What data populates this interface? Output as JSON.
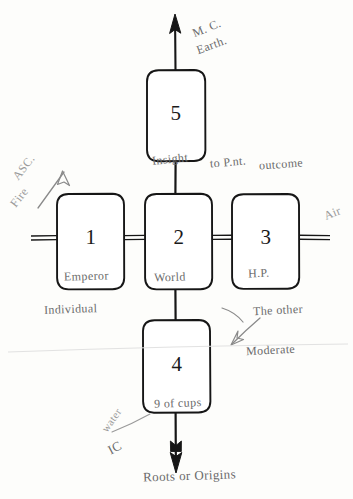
{
  "diagram": {
    "ink_color": "#1a1a1a",
    "pencil_color": "#6b6b6b",
    "paper_color": "#fdfdfb"
  },
  "boxes": [
    {
      "id": "box-1",
      "number": "1",
      "inner_label": "Emperor"
    },
    {
      "id": "box-2",
      "number": "2",
      "inner_label": "World"
    },
    {
      "id": "box-3",
      "number": "3",
      "inner_label": "H.P."
    },
    {
      "id": "box-4",
      "number": "4",
      "inner_label": "9 of cups"
    },
    {
      "id": "box-5",
      "number": "5",
      "inner_label": "Insight"
    }
  ],
  "annotations": {
    "top_mc": "M. C.",
    "top_earth": "Earth.",
    "left_asc": "ASC.",
    "left_fire": "Fire",
    "right_air": "Air",
    "to_point": "to P.nt.",
    "outcome": "outcome",
    "individual": "Individual",
    "the_other": "The other",
    "moderate": "Moderate",
    "water": "water",
    "ic": "IC",
    "roots": "Roots or Origins"
  }
}
